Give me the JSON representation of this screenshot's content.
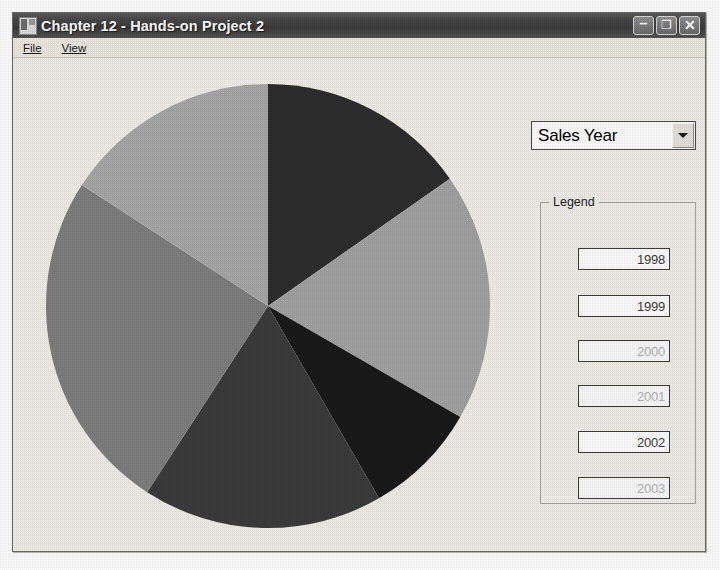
{
  "window": {
    "title": "Chapter 12 - Hands-on Project 2",
    "icon": "form-window-icon",
    "controls": {
      "minimize_label": "–",
      "minimize_icon": "minimize-icon",
      "maximize_label": "❐",
      "maximize_icon": "maximize-icon",
      "close_label": "✕",
      "close_icon": "close-icon"
    },
    "frame_color": "#6b6b6b",
    "titlebar_color": "#474747",
    "client_color": "#f1efe8"
  },
  "menu": {
    "items": [
      {
        "label": "File"
      },
      {
        "label": "View"
      }
    ]
  },
  "combo": {
    "label": "Sales Year",
    "selected": "Sales Year",
    "arrow_icon": "chevron-down-icon",
    "options": [
      "Sales Year"
    ]
  },
  "legend": {
    "caption": "Legend",
    "entries": [
      {
        "value": "1998",
        "dim": false
      },
      {
        "value": "1999",
        "dim": false
      },
      {
        "value": "2000",
        "dim": true
      },
      {
        "value": "2001",
        "dim": true
      },
      {
        "value": "2002",
        "dim": false
      },
      {
        "value": "2003",
        "dim": true
      }
    ]
  },
  "chart_data": {
    "type": "pie",
    "title": "",
    "xlabel": "",
    "ylabel": "",
    "categories": [
      "1998",
      "1999",
      "2000",
      "2001",
      "2002",
      "2003"
    ],
    "values": [
      55,
      65,
      30,
      63,
      90,
      57
    ],
    "unit": "degrees",
    "start_angle_deg": 0,
    "direction": "clockwise",
    "center": {
      "x": 225,
      "y": 225
    },
    "radius": 222,
    "legend_position": "right",
    "grid": false,
    "slices": [
      {
        "label": "1998",
        "angle_deg": 55,
        "percent": 15.3,
        "color": "#2e2e2e"
      },
      {
        "label": "1999",
        "angle_deg": 65,
        "percent": 18.1,
        "color": "#a3a3a3"
      },
      {
        "label": "2000",
        "angle_deg": 30,
        "percent": 8.3,
        "color": "#1a1a1a"
      },
      {
        "label": "2001",
        "angle_deg": 63,
        "percent": 17.5,
        "color": "#3c3c3c"
      },
      {
        "label": "2002",
        "angle_deg": 90,
        "percent": 25.0,
        "color": "#7f7f7f"
      },
      {
        "label": "2003",
        "angle_deg": 57,
        "percent": 15.8,
        "color": "#a8a8a8"
      }
    ]
  }
}
